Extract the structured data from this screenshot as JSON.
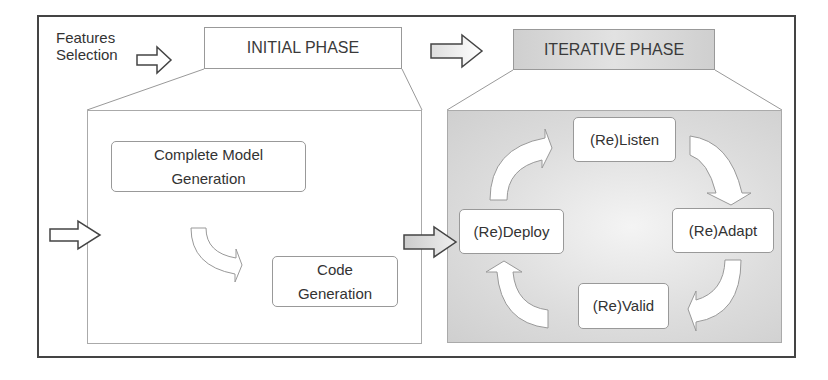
{
  "diagram": {
    "inputs": {
      "features_selection_line1": "Features",
      "features_selection_line2": "Selection"
    },
    "phases": [
      {
        "title": "INITIAL PHASE",
        "steps": [
          {
            "line1": "Complete Model",
            "line2": "Generation"
          },
          {
            "line1": "Code",
            "line2": "Generation"
          }
        ]
      },
      {
        "title": "ITERATIVE PHASE",
        "cycle": [
          "(Re)Listen",
          "(Re)Adapt",
          "(Re)Valid",
          "(Re)Deploy"
        ]
      }
    ],
    "colors": {
      "border": "#444444",
      "iterative_fill": "#d6d6d6",
      "node_fill": "#ffffff",
      "text": "#333333"
    }
  }
}
